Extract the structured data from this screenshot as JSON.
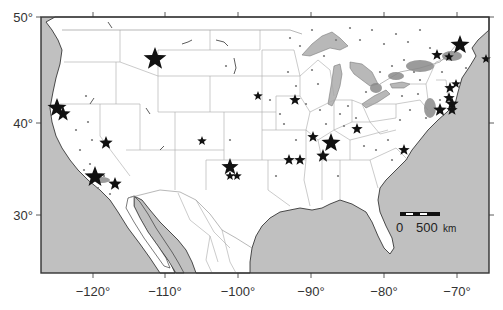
{
  "map": {
    "frame": {
      "x": 41,
      "y": 17,
      "width": 448,
      "height": 256
    },
    "colors": {
      "water": "#c0c0c0",
      "land": "#ffffff",
      "border": "#9a9a9a",
      "coast": "#222222",
      "frame": "#333333",
      "star": "#111111",
      "dot": "#7a7a7a"
    },
    "x_axis": {
      "ticks": [
        {
          "label": "−120°",
          "x": 93
        },
        {
          "label": "−110°",
          "x": 165
        },
        {
          "label": "−100°",
          "x": 238
        },
        {
          "label": "−90°",
          "x": 311
        },
        {
          "label": "−80°",
          "x": 384
        },
        {
          "label": "−70°",
          "x": 457
        }
      ]
    },
    "y_axis": {
      "ticks": [
        {
          "label": "50°",
          "y": 17
        },
        {
          "label": "40°",
          "y": 123
        },
        {
          "label": "30°",
          "y": 215
        }
      ]
    },
    "scale_bar": {
      "x": 400,
      "y": 213,
      "width": 40,
      "label_zero": "0",
      "label_distance": "500",
      "unit": "km"
    },
    "stars": [
      {
        "x": 155,
        "y": 59,
        "size": 12
      },
      {
        "x": 57,
        "y": 108,
        "size": 10
      },
      {
        "x": 63,
        "y": 114,
        "size": 8
      },
      {
        "x": 106,
        "y": 143,
        "size": 7
      },
      {
        "x": 95,
        "y": 177,
        "size": 11
      },
      {
        "x": 115,
        "y": 184,
        "size": 7
      },
      {
        "x": 202,
        "y": 141,
        "size": 5
      },
      {
        "x": 230,
        "y": 167,
        "size": 9
      },
      {
        "x": 230,
        "y": 176,
        "size": 5
      },
      {
        "x": 237,
        "y": 176,
        "size": 5
      },
      {
        "x": 258,
        "y": 96,
        "size": 5
      },
      {
        "x": 295,
        "y": 100,
        "size": 6
      },
      {
        "x": 289,
        "y": 160,
        "size": 6
      },
      {
        "x": 300,
        "y": 160,
        "size": 6
      },
      {
        "x": 313,
        "y": 137,
        "size": 6
      },
      {
        "x": 331,
        "y": 143,
        "size": 10
      },
      {
        "x": 323,
        "y": 156,
        "size": 7
      },
      {
        "x": 357,
        "y": 129,
        "size": 6
      },
      {
        "x": 404,
        "y": 150,
        "size": 6
      },
      {
        "x": 437,
        "y": 55,
        "size": 6
      },
      {
        "x": 449,
        "y": 57,
        "size": 5
      },
      {
        "x": 460,
        "y": 45,
        "size": 10
      },
      {
        "x": 486,
        "y": 59,
        "size": 5
      },
      {
        "x": 450,
        "y": 88,
        "size": 6
      },
      {
        "x": 456,
        "y": 84,
        "size": 5
      },
      {
        "x": 449,
        "y": 98,
        "size": 6
      },
      {
        "x": 452,
        "y": 104,
        "size": 7
      },
      {
        "x": 440,
        "y": 110,
        "size": 7
      },
      {
        "x": 452,
        "y": 110,
        "size": 6
      }
    ]
  }
}
